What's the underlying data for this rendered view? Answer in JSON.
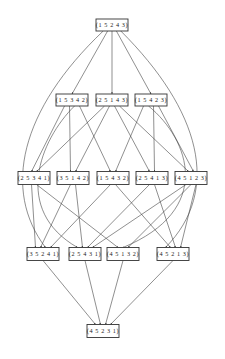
{
  "diagram": {
    "type": "hasse-diagram",
    "nodes": [
      {
        "id": "n0",
        "label": "(1 5 2 4 3)",
        "x": 112,
        "y": 25,
        "w": 32,
        "h": 12
      },
      {
        "id": "n1",
        "label": "(1 5 3 4 2)",
        "x": 72,
        "y": 100,
        "w": 32,
        "h": 12
      },
      {
        "id": "n2",
        "label": "(2 5 1 4 3)",
        "x": 112,
        "y": 100,
        "w": 32,
        "h": 12
      },
      {
        "id": "n3",
        "label": "(1 5 4 2 3)",
        "x": 151,
        "y": 100,
        "w": 32,
        "h": 12
      },
      {
        "id": "n4",
        "label": "(2 5 3 4 1)",
        "x": 34,
        "y": 178,
        "w": 32,
        "h": 13
      },
      {
        "id": "n5",
        "label": "(3 5 1 4 2)",
        "x": 73,
        "y": 178,
        "w": 32,
        "h": 13
      },
      {
        "id": "n6",
        "label": "(1 5 4 3 2)",
        "x": 113,
        "y": 178,
        "w": 32,
        "h": 13
      },
      {
        "id": "n7",
        "label": "(2 5 4 1 3)",
        "x": 152,
        "y": 178,
        "w": 32,
        "h": 13
      },
      {
        "id": "n8",
        "label": "(4 5 1 2 3)",
        "x": 191,
        "y": 178,
        "w": 32,
        "h": 13
      },
      {
        "id": "n9",
        "label": "(3 5 2 4 1)",
        "x": 43,
        "y": 254,
        "w": 32,
        "h": 13
      },
      {
        "id": "n10",
        "label": "(2 5 4 3 1)",
        "x": 85,
        "y": 254,
        "w": 32,
        "h": 13
      },
      {
        "id": "n11",
        "label": "(4 5 1 3 2)",
        "x": 123,
        "y": 254,
        "w": 32,
        "h": 13
      },
      {
        "id": "n12",
        "label": "(4 5 2 1 3)",
        "x": 173,
        "y": 254,
        "w": 32,
        "h": 13
      },
      {
        "id": "n13",
        "label": "(4 5 2 3 1)",
        "x": 103,
        "y": 331,
        "w": 32,
        "h": 13
      }
    ],
    "edges": [
      {
        "from": "n0",
        "to": "n1"
      },
      {
        "from": "n0",
        "to": "n2"
      },
      {
        "from": "n0",
        "to": "n3"
      },
      {
        "from": "n0",
        "to": "n9",
        "curve": "left"
      },
      {
        "from": "n0",
        "to": "n12",
        "curve": "right"
      },
      {
        "from": "n1",
        "to": "n4"
      },
      {
        "from": "n1",
        "to": "n5"
      },
      {
        "from": "n1",
        "to": "n6"
      },
      {
        "from": "n2",
        "to": "n4"
      },
      {
        "from": "n2",
        "to": "n5"
      },
      {
        "from": "n2",
        "to": "n7"
      },
      {
        "from": "n2",
        "to": "n8"
      },
      {
        "from": "n3",
        "to": "n6"
      },
      {
        "from": "n3",
        "to": "n7"
      },
      {
        "from": "n3",
        "to": "n8"
      },
      {
        "from": "n1",
        "to": "n10",
        "curve": "left2"
      },
      {
        "from": "n3",
        "to": "n11",
        "curve": "right2"
      },
      {
        "from": "n4",
        "to": "n9"
      },
      {
        "from": "n4",
        "to": "n11"
      },
      {
        "from": "n5",
        "to": "n9"
      },
      {
        "from": "n5",
        "to": "n10"
      },
      {
        "from": "n6",
        "to": "n9"
      },
      {
        "from": "n6",
        "to": "n12"
      },
      {
        "from": "n7",
        "to": "n10"
      },
      {
        "from": "n7",
        "to": "n12"
      },
      {
        "from": "n8",
        "to": "n10"
      },
      {
        "from": "n8",
        "to": "n11"
      },
      {
        "from": "n8",
        "to": "n12"
      },
      {
        "from": "n9",
        "to": "n13"
      },
      {
        "from": "n10",
        "to": "n13"
      },
      {
        "from": "n11",
        "to": "n13"
      },
      {
        "from": "n12",
        "to": "n13"
      }
    ],
    "colors": {
      "stroke": "#444444",
      "node_border": "#333333",
      "background": "#ffffff",
      "text": "#222222"
    }
  }
}
